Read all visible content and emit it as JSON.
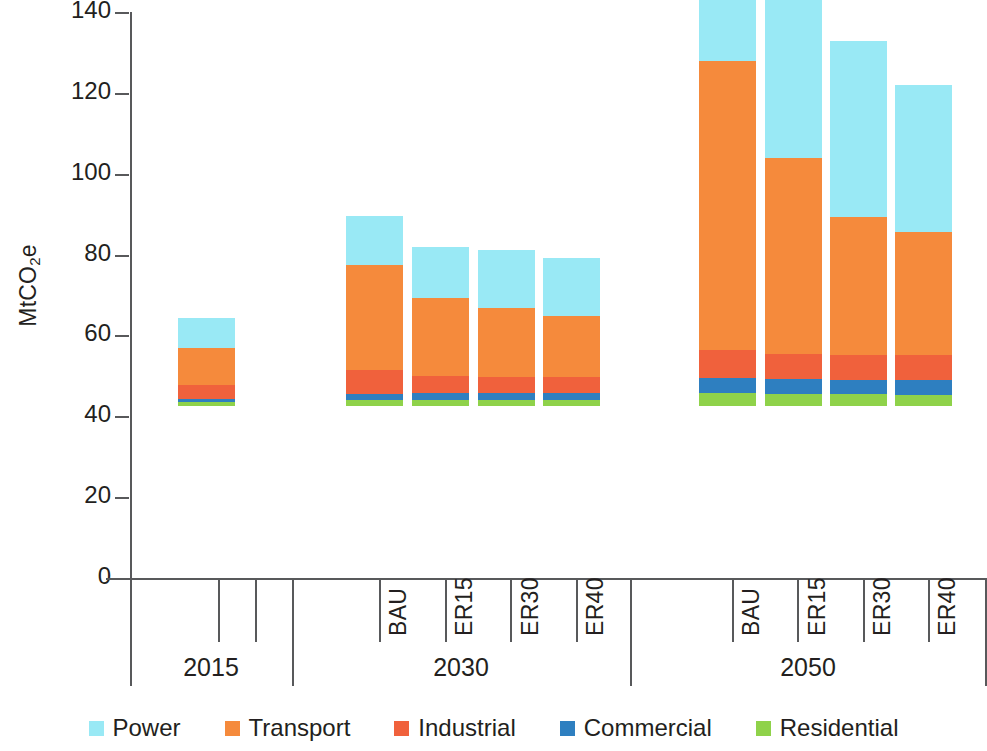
{
  "chart_data": {
    "type": "bar",
    "stacked": true,
    "title": "",
    "xlabel": "",
    "ylabel": "MtCO2e",
    "ylabel_html": "MtCO<sub>2</sub>e",
    "ylim": [
      0,
      140
    ],
    "yticks": [
      0,
      20,
      40,
      60,
      80,
      100,
      120,
      140
    ],
    "ytick_labels": [
      "0",
      "20",
      "40",
      "60",
      "80",
      "100",
      "120",
      "140"
    ],
    "grid": false,
    "legend_position": "bottom",
    "groups": [
      {
        "label": "2015",
        "categories": [
          "2015"
        ]
      },
      {
        "label": "2030",
        "categories": [
          "BAU",
          "ER15",
          "ER30",
          "ER40"
        ]
      },
      {
        "label": "2050",
        "categories": [
          "BAU",
          "ER15",
          "ER30",
          "ER40"
        ]
      }
    ],
    "categories": [
      "2015",
      "BAU",
      "ER15",
      "ER30",
      "ER40",
      "BAU",
      "ER15",
      "ER30",
      "ER40"
    ],
    "series": [
      {
        "name": "Residential",
        "color": "#8fd24a",
        "values": [
          1.0,
          1.5,
          1.6,
          1.6,
          1.6,
          3.1,
          3.0,
          2.9,
          2.8
        ]
      },
      {
        "name": "Commercial",
        "color": "#2e7fc0",
        "values": [
          0.8,
          1.5,
          1.6,
          1.6,
          1.6,
          3.8,
          3.6,
          3.6,
          3.6
        ]
      },
      {
        "name": "Industrial",
        "color": "#f0613c",
        "values": [
          3.4,
          6.0,
          4.2,
          4.0,
          3.9,
          7.0,
          6.2,
          6.0,
          6.1
        ]
      },
      {
        "name": "Transport",
        "color": "#f58a3c",
        "values": [
          9.1,
          25.8,
          19.4,
          17.0,
          15.1,
          71.4,
          48.6,
          34.2,
          30.6
        ]
      },
      {
        "name": "Power",
        "color": "#99e9f5",
        "values": [
          7.6,
          12.3,
          12.6,
          14.5,
          14.3,
          39.9,
          42.5,
          43.6,
          36.3
        ]
      }
    ],
    "totals": [
      21.9,
      47.1,
      39.4,
      38.7,
      36.5,
      125.2,
      103.9,
      90.3,
      79.4
    ]
  },
  "axis": {
    "y_label": "MtCO",
    "y_label_sub": "2",
    "y_label_tail": "e"
  },
  "legend": {
    "items": [
      {
        "label": "Power",
        "color": "#99e9f5"
      },
      {
        "label": "Transport",
        "color": "#f58a3c"
      },
      {
        "label": "Industrial",
        "color": "#f0613c"
      },
      {
        "label": "Commercial",
        "color": "#2e7fc0"
      },
      {
        "label": "Residential",
        "color": "#8fd24a"
      }
    ]
  }
}
